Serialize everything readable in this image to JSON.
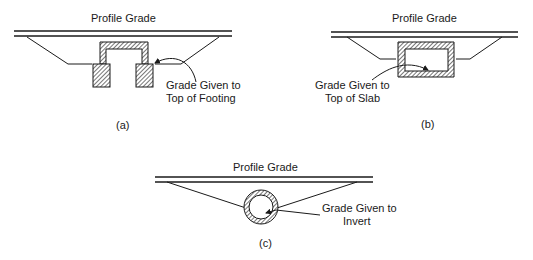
{
  "figure": {
    "panels": [
      {
        "id": "a",
        "title": "Profile Grade",
        "callout_line1": "Grade Given to",
        "callout_line2": "Top of Footing",
        "caption": "(a)",
        "structure": "three-sided culvert on spread footings"
      },
      {
        "id": "b",
        "title": "Profile Grade",
        "callout_line1": "Grade Given to",
        "callout_line2": "Top of Slab",
        "caption": "(b)",
        "structure": "box culvert"
      },
      {
        "id": "c",
        "title": "Profile Grade",
        "callout_line1": "Grade Given to",
        "callout_line2": "Invert",
        "caption": "(c)",
        "structure": "pipe culvert"
      }
    ],
    "colors": {
      "line": "#1a1a1a",
      "background": "#ffffff"
    }
  }
}
